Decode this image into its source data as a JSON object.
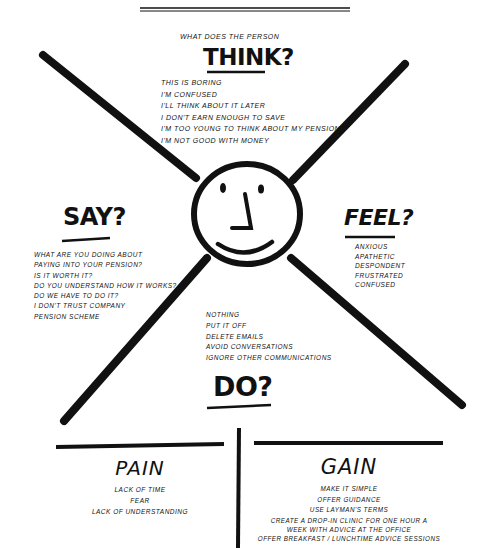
{
  "think": {
    "subtitle": "What does the person",
    "title": "THINK?",
    "items": [
      "This is boring",
      "I'm confused",
      "I'll think about it later",
      "I don't earn enough to save",
      "I'm too young to think about my pension",
      "I'm not good with money"
    ]
  },
  "say": {
    "title": "SAY?",
    "items": [
      "What are you doing about",
      "paying into your pension?",
      "Is it worth it?",
      "Do you understand how it works?",
      "Do we have to do it?",
      "I don't trust company",
      "pension scheme"
    ]
  },
  "feel": {
    "title": "FEEL?",
    "items": [
      "Anxious",
      "Apathetic",
      "Despondent",
      "Frustrated",
      "Confused"
    ]
  },
  "do": {
    "title": "DO?",
    "items": [
      "Nothing",
      "Put it off",
      "Delete emails",
      "Avoid conversations",
      "Ignore other communications"
    ]
  },
  "pain": {
    "title": "PAIN",
    "items": [
      "Lack of time",
      "Fear",
      "Lack of understanding"
    ]
  },
  "gain": {
    "title": "GAIN",
    "items": [
      "Make it simple",
      "Offer guidance",
      "Use layman's terms",
      "Create a drop-in clinic for one hour a",
      "week with advice at the office",
      "Offer breakfast / lunchtime advice sessions"
    ]
  },
  "colors": {
    "ink": "#111111",
    "paper": "#ffffff"
  }
}
